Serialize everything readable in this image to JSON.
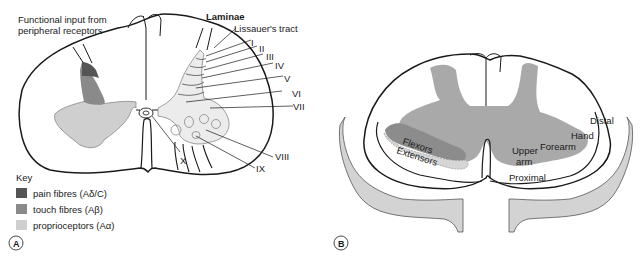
{
  "panel_a": {
    "badge": "A",
    "heading_input": [
      "Functional input from",
      "peripheral receptors"
    ],
    "laminae_title": "Laminae",
    "lissauer": "Lissauer's tract",
    "laminae": [
      "I",
      "II",
      "III",
      "IV",
      "V",
      "VI",
      "VII",
      "VIII",
      "IX",
      "X"
    ],
    "key": {
      "title": "Key",
      "items": [
        {
          "label": "pain fibres (Aδ/C)",
          "color": "#555555"
        },
        {
          "label": "touch fibres (Aβ)",
          "color": "#8a8a8a"
        },
        {
          "label": "proprioceptors (Aα)",
          "color": "#cfcfcf"
        }
      ]
    }
  },
  "panel_b": {
    "badge": "B",
    "labels": {
      "flexors": "Flexors",
      "extensors": "Extensors",
      "upper": "Upper",
      "arm": "arm",
      "forearm": "Forearm",
      "hand": "Hand",
      "distal": "Distal",
      "proximal": "Proximal"
    },
    "colors": {
      "grey_matter": "#a9a9a9",
      "flexors": "#8c8c8c",
      "extensors": "#d6d6d6",
      "limb": "#d3d3d3"
    }
  }
}
